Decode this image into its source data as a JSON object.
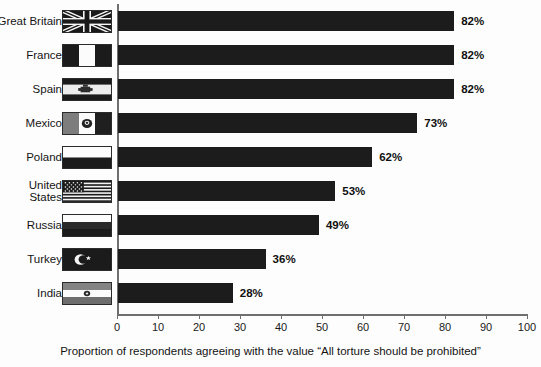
{
  "chart_data": {
    "type": "bar",
    "orientation": "horizontal",
    "title": "",
    "xlabel": "Proportion of respondents agreeing with the value “All torture should be prohibited”",
    "ylabel": "",
    "xlim": [
      0,
      100
    ],
    "xticks": [
      0,
      10,
      20,
      30,
      40,
      50,
      60,
      70,
      80,
      90,
      100
    ],
    "grid": false,
    "legend": null,
    "bar_color": "#1c1c1c",
    "value_suffix": "%",
    "categories": [
      "Great Britain",
      "France",
      "Spain",
      "Mexico",
      "Poland",
      "United States",
      "Russia",
      "Turkey",
      "India"
    ],
    "values": [
      82,
      82,
      82,
      73,
      62,
      53,
      49,
      36,
      28
    ],
    "data_labels": [
      "82%",
      "82%",
      "82%",
      "73%",
      "62%",
      "53%",
      "49%",
      "36%",
      "28%"
    ],
    "rows": [
      {
        "label": "Great Britain",
        "value": 82,
        "data_label": "82%",
        "flag": "flag-great-britain"
      },
      {
        "label": "France",
        "value": 82,
        "data_label": "82%",
        "flag": "flag-france"
      },
      {
        "label": "Spain",
        "value": 82,
        "data_label": "82%",
        "flag": "flag-spain"
      },
      {
        "label": "Mexico",
        "value": 73,
        "data_label": "73%",
        "flag": "flag-mexico"
      },
      {
        "label": "Poland",
        "value": 62,
        "data_label": "62%",
        "flag": "flag-poland"
      },
      {
        "label": "United\nStates",
        "value": 53,
        "data_label": "53%",
        "flag": "flag-united-states"
      },
      {
        "label": "Russia",
        "value": 49,
        "data_label": "49%",
        "flag": "flag-russia"
      },
      {
        "label": "Turkey",
        "value": 36,
        "data_label": "36%",
        "flag": "flag-turkey"
      },
      {
        "label": "India",
        "value": 28,
        "data_label": "28%",
        "flag": "flag-india"
      }
    ]
  },
  "axis": {
    "tick_labels": [
      "0",
      "10",
      "20",
      "30",
      "40",
      "50",
      "60",
      "70",
      "80",
      "90",
      "100"
    ],
    "caption": "Proportion of respondents agreeing with the value “All torture should be prohibited”"
  }
}
